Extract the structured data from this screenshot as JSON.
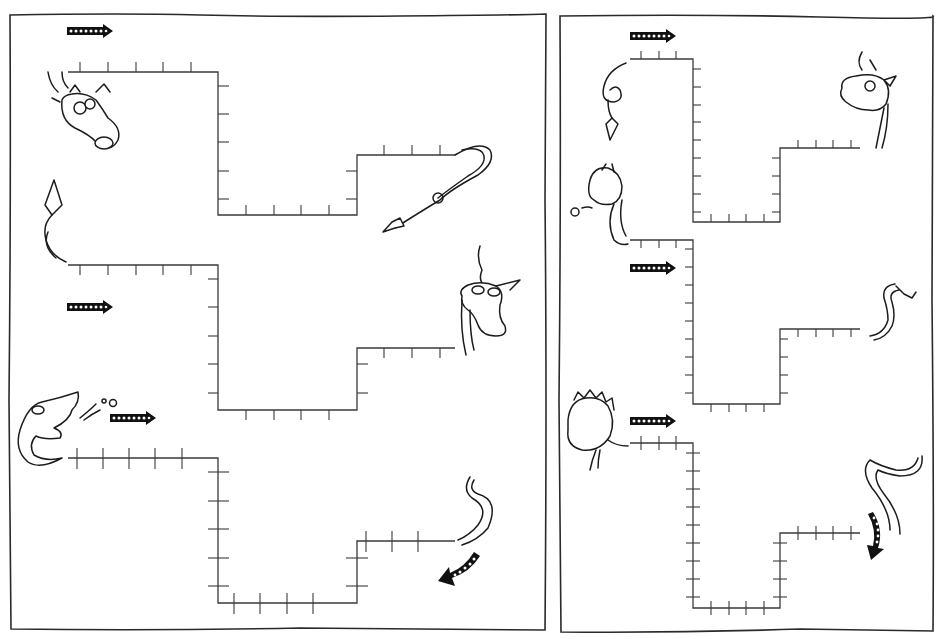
{
  "worksheet": {
    "title": "",
    "panels": [
      {
        "id": "left-panel",
        "paths": [
          {
            "start_creature": "dragon-head-antlers",
            "end_creature": "dragon-tail-spiral",
            "direction": "right"
          },
          {
            "start_creature": "dragon-tail-up",
            "end_creature": "dragon-head-unicorn",
            "direction": "right"
          },
          {
            "start_creature": "dragon-head-fire-breathing",
            "end_creature": "dragon-tail-curl",
            "direction": "right-then-curve-down"
          }
        ]
      },
      {
        "id": "right-panel",
        "paths": [
          {
            "start_creature": "dragon-tail-spiral-down",
            "end_creature": "dragon-head-smiling",
            "direction": "right"
          },
          {
            "start_creature": "dragon-head-smoke",
            "end_creature": "dragon-tail-s",
            "direction": "right"
          },
          {
            "start_creature": "dragon-head-spiky",
            "end_creature": "dragon-tail-long",
            "direction": "right-then-curve-down"
          }
        ]
      }
    ],
    "icons": {
      "arrow": "dotted-arrow-icon",
      "curved_arrow": "curved-dotted-arrow-icon"
    },
    "colors": {
      "ink": "#1c1c1c",
      "ruler_line": "#3a3a3a",
      "paper": "#ffffff"
    }
  }
}
